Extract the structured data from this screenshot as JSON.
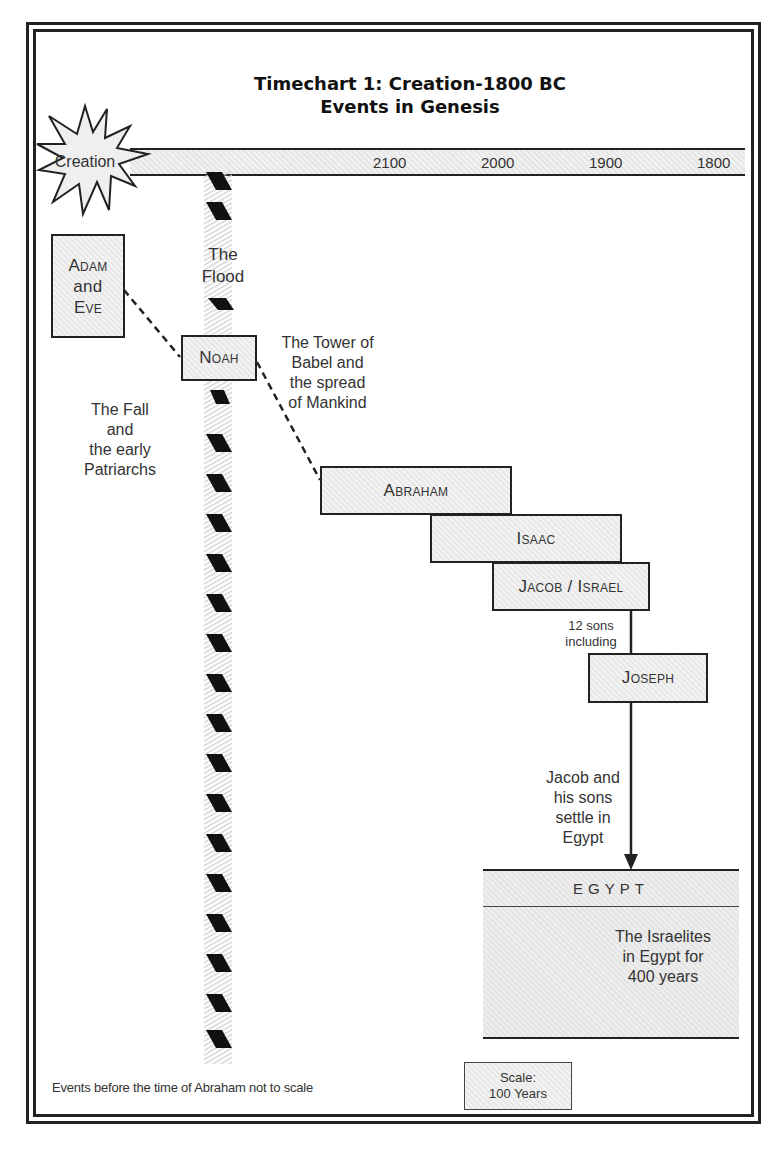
{
  "title": {
    "line1": "Timechart 1: Creation-1800 BC",
    "line2": "Events in Genesis"
  },
  "timeline": {
    "start_label": "Creation",
    "ticks": [
      "2100",
      "2000",
      "1900",
      "1800"
    ]
  },
  "boxes": {
    "adam": {
      "line1": "Adam",
      "line2": "and",
      "line3": "Eve"
    },
    "noah": "Noah",
    "abraham": "Abraham",
    "isaac": "Isaac",
    "jacob": "Jacob / Israel",
    "joseph": "Joseph"
  },
  "annotations": {
    "flood": {
      "line1": "The",
      "line2": "Flood"
    },
    "fall": {
      "line1": "The Fall",
      "line2": "and",
      "line3": "the early",
      "line4": "Patriarchs"
    },
    "babel": {
      "line1": "The Tower of",
      "line2": "Babel and",
      "line3": "the spread",
      "line4": "of Mankind"
    },
    "sons": {
      "line1": "12 sons",
      "line2": "including"
    },
    "settle": {
      "line1": "Jacob and",
      "line2": "his sons",
      "line3": "settle in",
      "line4": "Egypt"
    }
  },
  "egypt": {
    "header": "EGYPT",
    "text": {
      "line1": "The Israelites",
      "line2": "in Egypt for",
      "line3": "400 years"
    }
  },
  "footnote": "Events before the time of Abraham not to scale",
  "scale": {
    "line1": "Scale:",
    "line2": "100 Years"
  },
  "colors": {
    "stroke": "#222222",
    "fill": "#eeeeee",
    "text": "#333333"
  }
}
